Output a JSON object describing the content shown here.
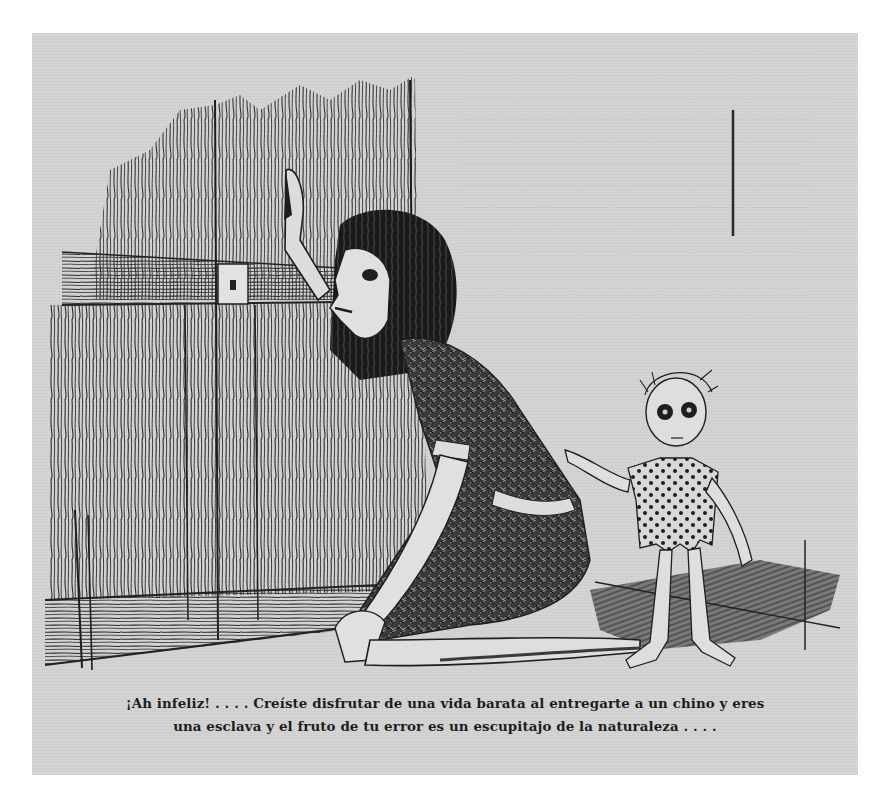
{
  "illustration": {
    "description": "Engraving: a gaunt long-haired woman kneels on the floor at a closed wooden plank door, one hand raised against it; a small emaciated child in a torn polka-dot shirt stands beside her, touching her back.",
    "background_color": "#d3d3d3",
    "ink_color": "#1e1e1e",
    "elements": [
      {
        "name": "wooden-door",
        "desc": "plank door with horizontal crossbar and iron hinge/lock plate"
      },
      {
        "name": "kneeling-woman",
        "desc": "woman with long dark hair, patterned dress, hand pressed to door"
      },
      {
        "name": "child",
        "desc": "thin child with large dark eyes, tattered polka-dot shirt, barefoot"
      },
      {
        "name": "floor-shadow",
        "desc": "hatched shadow cast on the floor to the right"
      }
    ]
  },
  "caption": {
    "line1": "¡Ah infeliz! . . . . Creíste disfrutar de una vida barata al entregarte a un chino y eres",
    "line2": "una esclava y el fruto de tu error es un escupitajo de la naturaleza . . . ."
  }
}
